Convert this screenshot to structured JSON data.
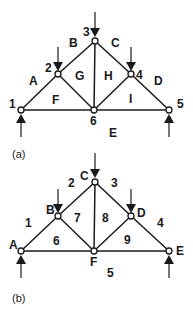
{
  "figures": [
    {
      "caption": "(a)",
      "notation": "Bow's notation - nodes numbered, spaces lettered",
      "node_labels": {
        "n1": "1",
        "n2": "2",
        "n3": "3",
        "n4": "4",
        "n5": "5",
        "n6": "6"
      },
      "space_labels": {
        "outer_left": "A",
        "outer_upper_left": "B",
        "outer_upper_right": "C",
        "outer_right": "D",
        "outer_bottom": "E",
        "inner_1": "F",
        "inner_2": "G",
        "inner_3": "H",
        "inner_4": "I"
      }
    },
    {
      "caption": "(b)",
      "notation": "Nodes lettered, spaces numbered",
      "node_labels": {
        "n1": "A",
        "n2": "B",
        "n3": "C",
        "n4": "D",
        "n5": "E",
        "n6": "F"
      },
      "space_labels": {
        "outer_left": "1",
        "outer_upper_left": "2",
        "outer_upper_right": "3",
        "outer_right": "4",
        "outer_bottom": "5",
        "inner_1": "6",
        "inner_2": "7",
        "inner_3": "8",
        "inner_4": "9"
      }
    }
  ],
  "colors": {
    "ink": "#1a1a1a",
    "background": "#ffffff"
  }
}
